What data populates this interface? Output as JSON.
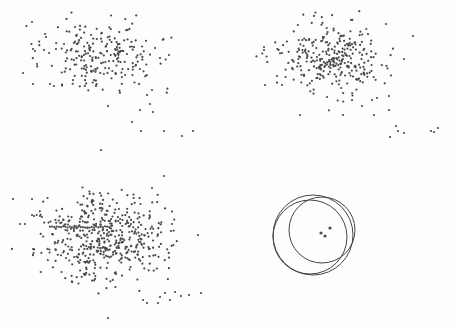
{
  "figure": {
    "background": "#fdfdfd",
    "point_color": "#4a4a4a",
    "line_color": "#444444"
  },
  "chart_data": [
    {
      "type": "scatter",
      "panel": "top-left",
      "title": "",
      "xlabel": "",
      "ylabel": "",
      "grid": false,
      "bbox": [
        20,
        10,
        215,
        160
      ],
      "cloud": {
        "cx": 102,
        "cy": 57,
        "sx": 28,
        "sy": 18,
        "n": 230,
        "seed": 11
      },
      "outliers": [
        [
          32,
          22
        ],
        [
          45,
          34
        ],
        [
          33,
          49
        ],
        [
          35,
          51
        ],
        [
          37,
          64
        ],
        [
          33,
          84
        ],
        [
          50,
          84
        ],
        [
          44,
          50
        ],
        [
          49,
          53
        ],
        [
          56,
          49
        ],
        [
          164,
          176
        ],
        [
          164,
          131
        ],
        [
          141,
          131
        ],
        [
          182,
          136
        ],
        [
          193,
          131
        ],
        [
          101,
          150
        ],
        [
          140,
          110
        ],
        [
          132,
          122
        ],
        [
          153,
          112
        ],
        [
          150,
          104
        ],
        [
          160,
          58
        ],
        [
          155,
          48
        ],
        [
          152,
          90
        ],
        [
          147,
          95
        ]
      ]
    },
    {
      "type": "scatter",
      "panel": "top-right",
      "title": "",
      "xlabel": "",
      "ylabel": "",
      "grid": false,
      "bbox": [
        255,
        10,
        450,
        160
      ],
      "cloud": {
        "cx": 330,
        "cy": 58,
        "sx": 25,
        "sy": 17,
        "n": 300,
        "seed": 23
      },
      "outliers": [
        [
          264,
          47
        ],
        [
          264,
          50
        ],
        [
          265,
          85
        ],
        [
          282,
          53
        ],
        [
          277,
          76
        ],
        [
          282,
          85
        ],
        [
          300,
          115
        ],
        [
          343,
          115
        ],
        [
          374,
          115
        ],
        [
          386,
          24
        ],
        [
          413,
          36
        ],
        [
          404,
          59
        ],
        [
          389,
          96
        ],
        [
          389,
          110
        ],
        [
          396,
          126
        ],
        [
          398,
          131
        ],
        [
          404,
          133
        ],
        [
          390,
          137
        ],
        [
          431,
          131
        ],
        [
          438,
          128
        ],
        [
          434,
          132
        ],
        [
          352,
          100
        ],
        [
          362,
          106
        ],
        [
          372,
          100
        ],
        [
          377,
          98
        ]
      ]
    },
    {
      "type": "scatter",
      "panel": "bottom-left",
      "title": "",
      "xlabel": "",
      "ylabel": "",
      "grid": false,
      "bbox": [
        10,
        180,
        215,
        320
      ],
      "cloud": {
        "cx": 105,
        "cy": 240,
        "sx": 30,
        "sy": 22,
        "n": 480,
        "seed": 37
      },
      "outliers": [
        [
          13,
          199
        ],
        [
          32,
          199
        ],
        [
          20,
          224
        ],
        [
          25,
          224
        ],
        [
          32,
          215
        ],
        [
          34,
          216
        ],
        [
          33,
          249
        ],
        [
          40,
          216
        ],
        [
          42,
          217
        ],
        [
          108,
          318
        ],
        [
          152,
          188
        ],
        [
          172,
          224
        ],
        [
          198,
          235
        ],
        [
          165,
          293
        ],
        [
          175,
          292
        ],
        [
          181,
          296
        ],
        [
          189,
          295
        ],
        [
          201,
          293
        ],
        [
          170,
          300
        ],
        [
          158,
          303
        ],
        [
          143,
          300
        ],
        [
          147,
          303
        ],
        [
          160,
          297
        ]
      ],
      "streak": {
        "x1": 50,
        "y1": 227,
        "x2": 110,
        "y2": 227
      }
    },
    {
      "type": "scatter",
      "panel": "bottom-right",
      "title": "",
      "xlabel": "",
      "ylabel": "",
      "grid": false,
      "bbox": [
        255,
        180,
        450,
        320
      ],
      "circles": [
        {
          "cx": 313,
          "cy": 235,
          "r": 40
        },
        {
          "cx": 310,
          "cy": 237,
          "r": 37
        },
        {
          "cx": 322,
          "cy": 230,
          "r": 33
        }
      ],
      "points": [
        [
          321,
          233
        ],
        [
          325,
          236
        ],
        [
          330,
          228
        ]
      ]
    }
  ]
}
